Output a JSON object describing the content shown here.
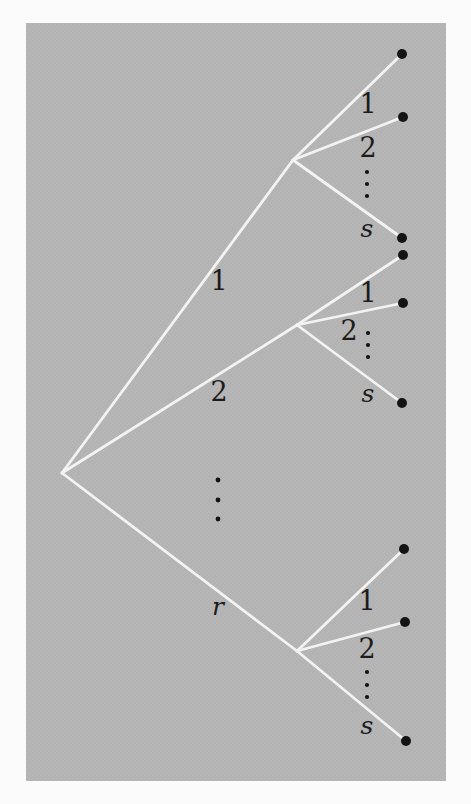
{
  "diagram": {
    "colors": {
      "page": "#fbfbfb",
      "panel": "#b5b5b5",
      "panel_texture": "#a9a9a9",
      "line": "#f3f3f3",
      "node": "#141414",
      "label": "#1c1c1c"
    },
    "level1": {
      "branches": [
        {
          "label": "1"
        },
        {
          "label": "2"
        },
        {
          "label": "r"
        }
      ],
      "ellipsis_dots": 3
    },
    "level2_groups": [
      {
        "parent": "1",
        "branches": [
          {
            "label": "1"
          },
          {
            "label": "2"
          },
          {
            "label": "s"
          }
        ],
        "ellipsis_dots": 3
      },
      {
        "parent": "2",
        "branches": [
          {
            "label": "1"
          },
          {
            "label": "2"
          },
          {
            "label": "s"
          }
        ],
        "ellipsis_dots": 3
      },
      {
        "parent": "r",
        "branches": [
          {
            "label": "1"
          },
          {
            "label": "2"
          },
          {
            "label": "s"
          }
        ],
        "ellipsis_dots": 3
      }
    ]
  }
}
